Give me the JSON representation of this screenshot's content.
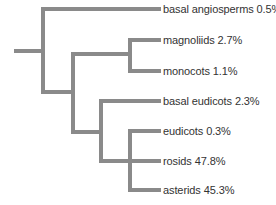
{
  "diagram": {
    "type": "phylogenetic-tree",
    "line_color": "#8a8a8a",
    "text_color": "#333333",
    "leaves": [
      {
        "name": "basal angiosperms",
        "percent": "0.5%",
        "label": "basal angiosperms 0.5%"
      },
      {
        "name": "magnoliids",
        "percent": "2.7%",
        "label": "magnoliids 2.7%"
      },
      {
        "name": "monocots",
        "percent": "1.1%",
        "label": "monocots 1.1%"
      },
      {
        "name": "basal eudicots",
        "percent": "2.3%",
        "label": "basal eudicots 2.3%"
      },
      {
        "name": "eudicots",
        "percent": "0.3%",
        "label": "eudicots 0.3%"
      },
      {
        "name": "rosids",
        "percent": "47.8%",
        "label": "rosids 47.8%"
      },
      {
        "name": "asterids",
        "percent": "45.3%",
        "label": "asterids 45.3%"
      }
    ],
    "topology": "(basal angiosperms,((magnoliids,monocots),(basal eudicots,(eudicots,rosids,asterids))))"
  }
}
